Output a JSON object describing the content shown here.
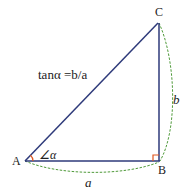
{
  "diagram": {
    "type": "right-triangle",
    "vertices": {
      "A": {
        "label": "A",
        "x": 25,
        "y": 161
      },
      "B": {
        "label": "B",
        "x": 159,
        "y": 161
      },
      "C": {
        "label": "C",
        "x": 158,
        "y": 23
      }
    },
    "formula": "tanα =b/a",
    "angle_label": "∠α",
    "side_labels": {
      "opposite": "b",
      "adjacent": "a"
    },
    "colors": {
      "edge": "#2e3a7a",
      "dashed_arc": "#4f9a3a",
      "angle_mark": "#e0561e",
      "text": "#222222"
    }
  }
}
